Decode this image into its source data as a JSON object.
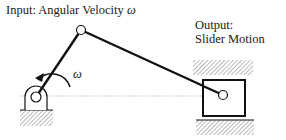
{
  "labels": {
    "input_prefix": "Input: Angular Velocity ",
    "input_symbol": "ω",
    "output_line1": "Output:",
    "output_line2": "Slider Motion",
    "crank_omega": "ω"
  },
  "colors": {
    "line": "#111111",
    "hatch": "#777777",
    "dotted": "#999999",
    "background": "#ffffff"
  },
  "geometry": {
    "crank_pivot": [
      36,
      97
    ],
    "crank_joint": [
      81,
      30
    ],
    "slider_pin": [
      223,
      95
    ],
    "slider_box": [
      203,
      80,
      42,
      36
    ]
  }
}
